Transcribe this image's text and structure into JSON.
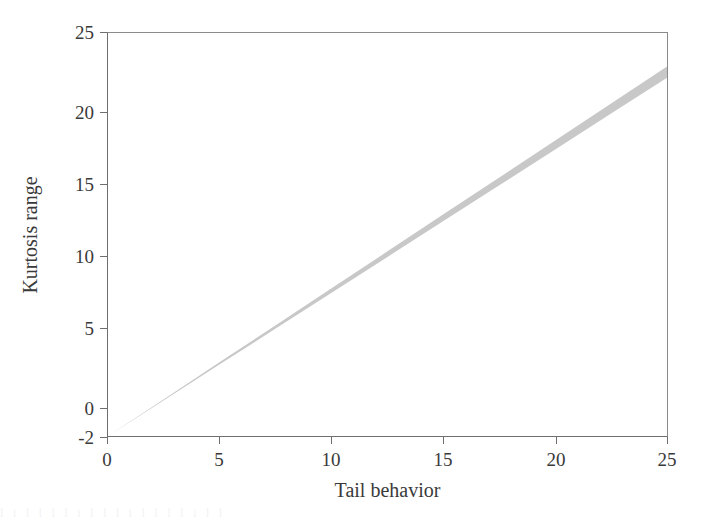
{
  "figure": {
    "background_color": "#ffffff",
    "frame_color": "#6e6e6e",
    "text_color": "#3a3a3a",
    "artifact_text": "l  i   l l  l   l i l   l  l i l  l l   l    i  l     l"
  },
  "chart_data": {
    "type": "area",
    "title": "",
    "xlabel": "Tail behavior",
    "ylabel": "Kurtosis range",
    "xlim": [
      0,
      25
    ],
    "ylim": [
      -2,
      25
    ],
    "xticks": [
      0,
      5,
      10,
      15,
      20,
      25
    ],
    "yticks": [
      -2,
      0,
      5,
      10,
      15,
      20,
      25
    ],
    "xtick_labels": [
      "0",
      "5",
      "10",
      "15",
      "20",
      "25"
    ],
    "ytick_labels": [
      "-2",
      "0",
      "5",
      "10",
      "15",
      "20",
      "25"
    ],
    "grid": false,
    "legend": null,
    "band_color": "#c8c8c8",
    "series": [
      {
        "name": "Feasible region",
        "kind": "band",
        "x": [
          0,
          2.5,
          5,
          7.5,
          10,
          12.5,
          15,
          17.5,
          20,
          22.5,
          25
        ],
        "y_upper": [
          -2.0,
          0.47,
          2.95,
          5.42,
          7.9,
          10.37,
          12.85,
          15.32,
          17.8,
          20.27,
          22.75
        ],
        "y_lower": [
          -2.0,
          0.4,
          2.8,
          5.2,
          7.6,
          10.0,
          12.4,
          14.8,
          17.2,
          19.6,
          22.0
        ]
      }
    ]
  }
}
